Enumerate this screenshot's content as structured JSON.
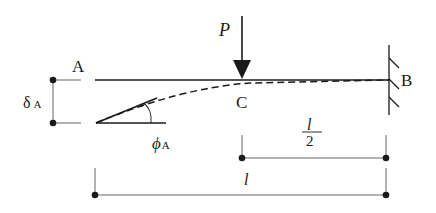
{
  "diagram": {
    "labels": {
      "point_a": "A",
      "point_b": "B",
      "point_c": "C",
      "load": "P",
      "deflection_symbol": "δ",
      "deflection_sub": "A",
      "rotation_symbol": "ϕ",
      "rotation_sub": "A",
      "half_length_num": "l",
      "half_length_den": "2",
      "full_length": "l"
    },
    "colors": {
      "line": "#1a1a1a",
      "dim_line": "#555555",
      "background": "#ffffff"
    }
  }
}
